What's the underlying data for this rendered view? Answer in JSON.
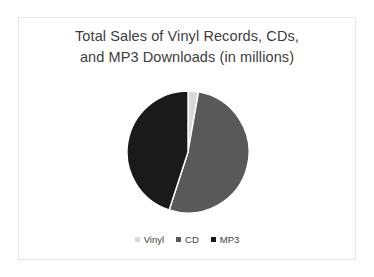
{
  "slide": {
    "background_color": "#ffffff",
    "frame_color": "#e6e6e6"
  },
  "chart_data": {
    "type": "pie",
    "title": "Total Sales of Vinyl Records, CDs, and MP3 Downloads (in millions)",
    "title_line1": "Total Sales of Vinyl Records, CDs,",
    "title_line2": "and MP3 Downloads (in millions)",
    "xlabel": "",
    "ylabel": "",
    "categories": [
      "Vinyl",
      "CD",
      "MP3"
    ],
    "values": [
      10,
      188,
      162
    ],
    "value_unit": "degrees",
    "colors": [
      "#d9d9d9",
      "#595959",
      "#1a1a1a"
    ],
    "start_angle_deg": 0,
    "direction": "clockwise",
    "legend_position": "bottom",
    "grid": false,
    "slices": [
      {
        "label": "Vinyl",
        "angle_deg": 10,
        "color": "#d9d9d9"
      },
      {
        "label": "CD",
        "angle_deg": 188,
        "color": "#595959"
      },
      {
        "label": "MP3",
        "angle_deg": 162,
        "color": "#1a1a1a"
      }
    ],
    "legend": [
      {
        "label": "Vinyl",
        "color": "#d9d9d9"
      },
      {
        "label": "CD",
        "color": "#595959"
      },
      {
        "label": "MP3",
        "color": "#1a1a1a"
      }
    ]
  }
}
